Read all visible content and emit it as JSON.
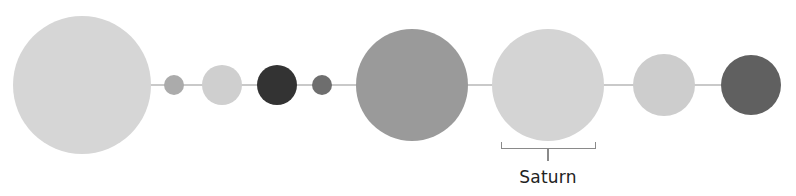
{
  "diagram": {
    "title": "",
    "orbit_line_color": "#c9c9c9",
    "center_y": 85,
    "bodies": [
      {
        "name": "Sun",
        "cx": 82,
        "r": 69,
        "color": "#d6d6d6"
      },
      {
        "name": "Mercury",
        "cx": 174,
        "r": 10,
        "color": "#ababab"
      },
      {
        "name": "Venus",
        "cx": 222,
        "r": 20,
        "color": "#cfcfcf"
      },
      {
        "name": "Earth",
        "cx": 277,
        "r": 20,
        "color": "#333333"
      },
      {
        "name": "Mars",
        "cx": 322,
        "r": 10,
        "color": "#6e6e6e"
      },
      {
        "name": "Jupiter",
        "cx": 412,
        "r": 56,
        "color": "#9a9a9a"
      },
      {
        "name": "Saturn",
        "cx": 548,
        "r": 56,
        "color": "#d4d4d4"
      },
      {
        "name": "Uranus",
        "cx": 664,
        "r": 31,
        "color": "#cdcdcd"
      },
      {
        "name": "Neptune",
        "cx": 751,
        "r": 30,
        "color": "#606060"
      }
    ],
    "highlight": {
      "label": "Saturn",
      "bracket_left": 501,
      "bracket_right": 596,
      "bracket_top": 142,
      "bracket_bottom": 149,
      "stem_bottom": 161,
      "label_x": 548,
      "label_y": 167,
      "bracket_color": "#8a8a8a",
      "label_color": "#222222"
    }
  }
}
